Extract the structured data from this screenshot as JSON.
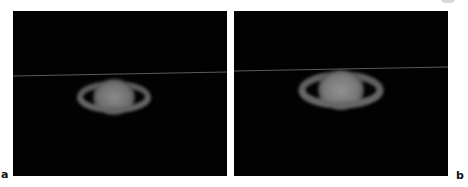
{
  "figure": {
    "panels": [
      {
        "id": "a",
        "label": "a",
        "subject": "Saturn with rings",
        "background_color": "#020202",
        "horizontal_line": {
          "y_left": 65,
          "y_right": 61,
          "color": "#5a5a5a"
        },
        "planet": {
          "cx": 101,
          "cy": 86,
          "rx": 22,
          "ry": 19
        },
        "rings": {
          "cx": 101,
          "cy": 86,
          "rx": 34,
          "ry": 13
        }
      },
      {
        "id": "b",
        "label": "b",
        "subject": "Saturn with rings",
        "background_color": "#020202",
        "horizontal_line": {
          "y_left": 60,
          "y_right": 56,
          "color": "#5a5a5a"
        },
        "planet": {
          "cx": 107,
          "cy": 79,
          "rx": 24,
          "ry": 21
        },
        "rings": {
          "cx": 107,
          "cy": 79,
          "rx": 39,
          "ry": 15
        }
      }
    ]
  }
}
